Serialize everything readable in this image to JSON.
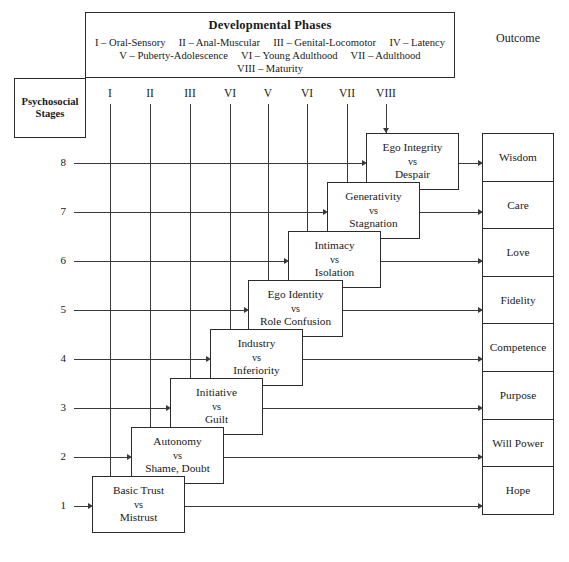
{
  "header": {
    "phases_title": "Developmental Phases",
    "phases_lines": [
      "I – Oral-Sensory     II – Anal-Muscular     III – Genital-Locomotor     IV – Latency",
      "V – Puberty-Adolescence     VI – Young Adulthood     VII – Adulthood",
      "VIII – Maturity"
    ],
    "outcome_title": "Outcome",
    "psychosocial_label_line1": "Psychosocial",
    "psychosocial_label_line2": "Stages"
  },
  "columns": {
    "romans": [
      "I",
      "II",
      "III",
      "VI",
      "V",
      "VI",
      "VII",
      "VIII"
    ]
  },
  "rows": {
    "numbers": [
      "8",
      "7",
      "6",
      "5",
      "4",
      "3",
      "2",
      "1"
    ]
  },
  "stages": [
    {
      "number": "8",
      "roman": "VIII",
      "crisis_positive": "Ego Integrity",
      "vs": "vs",
      "crisis_negative": "Despair",
      "outcome": "Wisdom"
    },
    {
      "number": "7",
      "roman": "VII",
      "crisis_positive": "Generativity",
      "vs": "vs",
      "crisis_negative": "Stagnation",
      "outcome": "Care"
    },
    {
      "number": "6",
      "roman": "VI",
      "crisis_positive": "Intimacy",
      "vs": "vs",
      "crisis_negative": "Isolation",
      "outcome": "Love"
    },
    {
      "number": "5",
      "roman": "V",
      "crisis_positive": "Ego Identity",
      "vs": "vs",
      "crisis_negative": "Role Confusion",
      "outcome": "Fidelity"
    },
    {
      "number": "4",
      "roman": "VI",
      "crisis_positive": "Industry",
      "vs": "vs",
      "crisis_negative": "Inferiority",
      "outcome": "Competence"
    },
    {
      "number": "3",
      "roman": "III",
      "crisis_positive": "Initiative",
      "vs": "vs",
      "crisis_negative": "Guilt",
      "outcome": "Purpose"
    },
    {
      "number": "2",
      "roman": "II",
      "crisis_positive": "Autonomy",
      "vs": "vs",
      "crisis_negative": "Shame, Doubt",
      "outcome": "Will Power"
    },
    {
      "number": "1",
      "roman": "I",
      "crisis_positive": "Basic Trust",
      "vs": "vs",
      "crisis_negative": "Mistrust",
      "outcome": "Hope"
    }
  ],
  "outcomes": [
    "Wisdom",
    "Care",
    "Love",
    "Fidelity",
    "Competence",
    "Purpose",
    "Will Power",
    "Hope"
  ],
  "colors": {
    "line": "#3a3a3a",
    "border": "#2b2b2b",
    "background": "#ffffff",
    "text": "#1a1a1a"
  }
}
